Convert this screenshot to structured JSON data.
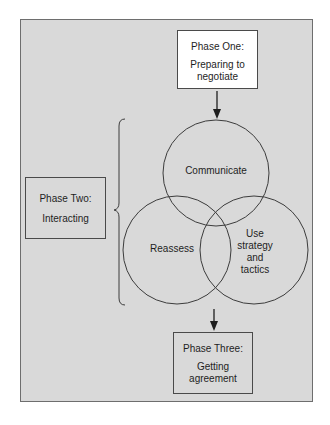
{
  "diagram": {
    "phase_one": {
      "title": "Phase One:",
      "description": "Preparing to negotiate"
    },
    "phase_two": {
      "title": "Phase Two:",
      "description": "Interacting"
    },
    "phase_three": {
      "title": "Phase Three:",
      "description": "Getting agreement"
    },
    "circles": [
      {
        "label": "Communicate"
      },
      {
        "label": "Reassess"
      },
      {
        "label": "Use strategy and tactics"
      }
    ],
    "colors": {
      "panel": "#d9d9d9",
      "box_phase_one": "#ffffff",
      "stroke": "#3c3c3c"
    }
  }
}
